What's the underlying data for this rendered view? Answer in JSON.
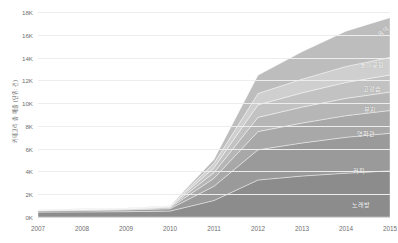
{
  "chart_data": {
    "type": "area",
    "stacked": true,
    "title": "",
    "xlabel": "",
    "ylabel": "카테고리 총 매출 (단위: 건)",
    "x": [
      2007,
      2008,
      2009,
      2010,
      2011,
      2012,
      2013,
      2014,
      2015
    ],
    "xtick_labels": [
      "2007",
      "2008",
      "2009",
      "2010",
      "2011",
      "2012",
      "2013",
      "2014",
      "2015"
    ],
    "ytick_labels": [
      "0K",
      "2K",
      "4K",
      "6K",
      "8K",
      "10K",
      "12K",
      "14K",
      "16K",
      "18K"
    ],
    "ytick_values": [
      0,
      2000,
      4000,
      6000,
      8000,
      10000,
      12000,
      14000,
      16000,
      18000
    ],
    "ylim": [
      0,
      18000
    ],
    "xlim": [
      2007,
      2015
    ],
    "grid": true,
    "legend_position": "inline-right",
    "series": [
      {
        "name": "노래방",
        "color": "#8c8c8c",
        "label_x": 2014.35,
        "label_y": 1100,
        "values": [
          430,
          450,
          470,
          520,
          1450,
          3250,
          3600,
          3850,
          4050
        ]
      },
      {
        "name": "커피",
        "color": "#9a9a9a",
        "label_x": 2014.3,
        "label_y": 4150,
        "values": [
          110,
          130,
          150,
          210,
          1250,
          2650,
          2900,
          3150,
          3300
        ]
      },
      {
        "name": "영화관",
        "color": "#a8a8a8",
        "label_x": 2014.45,
        "label_y": 7350,
        "values": [
          40,
          50,
          60,
          90,
          700,
          1600,
          1750,
          1900,
          2000
        ]
      },
      {
        "name": "뮤지",
        "color": "#b6b6b6",
        "label_x": 2014.55,
        "label_y": 9450,
        "values": [
          25,
          30,
          35,
          55,
          500,
          1250,
          1400,
          1520,
          1620
        ]
      },
      {
        "name": "고강습",
        "color": "#c2c2c2",
        "label_x": 2014.6,
        "label_y": 11300,
        "values": [
          20,
          25,
          28,
          45,
          430,
          1100,
          1250,
          1400,
          1500
        ]
      },
      {
        "name": "놀이공원",
        "color": "#cfcfcf",
        "label_x": 2014.6,
        "label_y": 13400,
        "values": [
          15,
          18,
          22,
          35,
          380,
          1000,
          1200,
          1400,
          1550
        ]
      },
      {
        "name": "음악",
        "color": "#bdbdbd",
        "label_x": 2014.85,
        "label_y": 16300,
        "values": [
          10,
          12,
          15,
          25,
          340,
          1600,
          2400,
          3100,
          3480
        ]
      }
    ]
  }
}
